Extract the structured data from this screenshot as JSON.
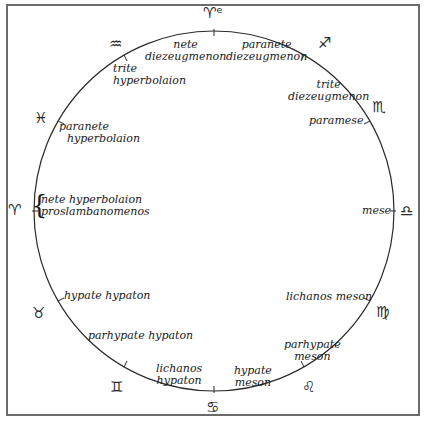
{
  "diagram": {
    "title": "",
    "circle": {
      "cx": 214,
      "cy": 211,
      "r": 180,
      "stroke": "#2a2a2a"
    },
    "zodiac": [
      {
        "name": "aries-top",
        "glyph": "♈ᵉ",
        "x": 203,
        "y": 6
      },
      {
        "name": "sagittarius",
        "glyph": "♐",
        "x": 320,
        "y": 36
      },
      {
        "name": "scorpio",
        "glyph": "♏",
        "x": 372,
        "y": 100
      },
      {
        "name": "libra",
        "glyph": "♎",
        "x": 400,
        "y": 204
      },
      {
        "name": "virgo",
        "glyph": "♍",
        "x": 375,
        "y": 305
      },
      {
        "name": "leo",
        "glyph": "♌",
        "x": 302,
        "y": 379
      },
      {
        "name": "cancer",
        "glyph": "♋",
        "x": 205,
        "y": 400
      },
      {
        "name": "gemini",
        "glyph": "♊",
        "x": 110,
        "y": 380
      },
      {
        "name": "taurus",
        "glyph": "♉",
        "x": 32,
        "y": 306
      },
      {
        "name": "aries-left",
        "glyph": "♈",
        "x": 8,
        "y": 203
      },
      {
        "name": "pisces",
        "glyph": "♓",
        "x": 34,
        "y": 111
      },
      {
        "name": "aquarius",
        "glyph": "♒",
        "x": 109,
        "y": 37
      }
    ],
    "labels": [
      {
        "name": "nete-diezeugmenon",
        "lines": [
          "nete",
          "diezeugmenon"
        ],
        "x": 145,
        "y": 39
      },
      {
        "name": "paranete-diezeugmenon",
        "lines": [
          "paranete",
          "diezeugmenon"
        ],
        "x": 226,
        "y": 39
      },
      {
        "name": "trite-hyperbolaion",
        "lines": [
          "trite",
          "hyperbolaion"
        ],
        "x": 113,
        "y": 63
      },
      {
        "name": "trite-diezeugmenon",
        "lines": [
          "trite",
          "diezeugmenon"
        ],
        "x": 290,
        "y": 79
      },
      {
        "name": "paramese",
        "lines": [
          "paramese"
        ],
        "x": 311,
        "y": 113
      },
      {
        "name": "paranete-hyperbolaion",
        "lines": [
          "paranete",
          "hyperbolaion"
        ],
        "x": 59,
        "y": 121
      },
      {
        "name": "nete-hyperbolaion-proslambanomenos",
        "lines": [
          "nete hyperbolaion",
          "proslambanomenos"
        ],
        "x": 40,
        "y": 194
      },
      {
        "name": "mese",
        "lines": [
          "mese"
        ],
        "x": 364,
        "y": 205
      },
      {
        "name": "hypate-hypaton",
        "lines": [
          "hypate hypaton"
        ],
        "x": 64,
        "y": 290
      },
      {
        "name": "lichanos-meson",
        "lines": [
          "lichanos meson"
        ],
        "x": 288,
        "y": 291
      },
      {
        "name": "parhypate-hypaton",
        "lines": [
          "parhypate hypaton"
        ],
        "x": 88,
        "y": 329
      },
      {
        "name": "parhypate-meson",
        "lines": [
          "parhypate",
          "meson"
        ],
        "x": 284,
        "y": 339
      },
      {
        "name": "lichanos-hypaton",
        "lines": [
          "lichanos",
          "hypaton"
        ],
        "x": 156,
        "y": 363
      },
      {
        "name": "hypate-meson",
        "lines": [
          "hypate",
          "meson"
        ],
        "x": 234,
        "y": 365
      }
    ]
  }
}
